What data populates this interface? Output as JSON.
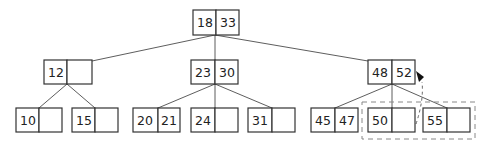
{
  "diagram": {
    "type": "b-tree",
    "root": {
      "keys": [
        "18",
        "33"
      ]
    },
    "level1": [
      {
        "id": "n12",
        "keys": [
          "12",
          ""
        ]
      },
      {
        "id": "n23_30",
        "keys": [
          "23",
          "30"
        ]
      },
      {
        "id": "n48_52",
        "keys": [
          "48",
          "52"
        ]
      }
    ],
    "leaves": [
      {
        "id": "l10",
        "parent": "n12",
        "keys": [
          "10",
          ""
        ]
      },
      {
        "id": "l15",
        "parent": "n12",
        "keys": [
          "15",
          ""
        ]
      },
      {
        "id": "l20_21",
        "parent": "n23_30",
        "keys": [
          "20",
          "21"
        ]
      },
      {
        "id": "l24",
        "parent": "n23_30",
        "keys": [
          "24",
          ""
        ]
      },
      {
        "id": "l31",
        "parent": "n23_30",
        "keys": [
          "31",
          ""
        ]
      },
      {
        "id": "l45_47",
        "parent": "n48_52",
        "keys": [
          "45",
          "47"
        ]
      },
      {
        "id": "l50",
        "parent": "n48_52",
        "keys": [
          "50",
          ""
        ]
      },
      {
        "id": "l55",
        "parent": "n48_52",
        "keys": [
          "55",
          ""
        ]
      }
    ],
    "highlight": {
      "style": "dashed-box",
      "encloses": [
        "l50",
        "l55"
      ],
      "arrow_to": "n48_52"
    }
  }
}
